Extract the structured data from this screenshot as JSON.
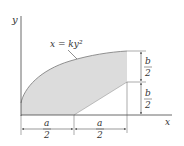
{
  "diagram": {
    "axes": {
      "x_label": "x",
      "y_label": "y"
    },
    "curve_label": "x = ky²",
    "region": {
      "fill_color": "#dcdcdc",
      "stroke_color": "#777777"
    },
    "dimensions": {
      "right_top": {
        "num": "b",
        "den": "2"
      },
      "right_bottom": {
        "num": "b",
        "den": "2"
      },
      "bottom_left": {
        "num": "a",
        "den": "2"
      },
      "bottom_right": {
        "num": "a",
        "den": "2"
      }
    }
  }
}
